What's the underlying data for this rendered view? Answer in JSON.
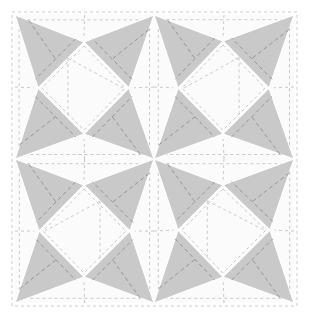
{
  "colors": {
    "gray": "#c9c9c9",
    "white": "#fbfbfb",
    "stitch_dark": "#8f8f8f",
    "stitch_light": "#bdbdbd"
  },
  "frame": {
    "x0": 15,
    "x1": 154,
    "x2": 294,
    "y0": 15,
    "y1": 159,
    "y2": 303
  },
  "blocks": [
    {
      "name": "block-upper-left",
      "box": [
        15,
        15,
        154,
        159
      ],
      "diamond": {
        "top": [
          84,
          42
        ],
        "left": [
          38,
          88
        ],
        "right": [
          129,
          88
        ],
        "bottom": [
          84,
          134
        ]
      },
      "diag": "ne"
    },
    {
      "name": "block-upper-right",
      "box": [
        154,
        15,
        294,
        159
      ],
      "diamond": {
        "top": [
          223,
          41
        ],
        "left": [
          178,
          88
        ],
        "right": [
          269,
          88
        ],
        "bottom": [
          223,
          134
        ]
      },
      "diag": "nw"
    },
    {
      "name": "block-lower-left",
      "box": [
        15,
        159,
        154,
        303
      ],
      "diamond": {
        "top": [
          84,
          185
        ],
        "left": [
          39,
          231
        ],
        "right": [
          130,
          231
        ],
        "bottom": [
          84,
          277
        ]
      },
      "diag": "nw"
    },
    {
      "name": "block-lower-right",
      "box": [
        154,
        159,
        294,
        303
      ],
      "diamond": {
        "top": [
          223,
          185
        ],
        "left": [
          178,
          230
        ],
        "right": [
          270,
          230
        ],
        "bottom": [
          223,
          277
        ]
      },
      "diag": "ne"
    }
  ]
}
